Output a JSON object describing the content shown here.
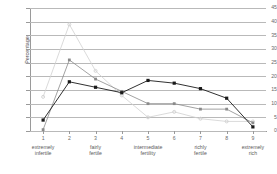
{
  "chart_data": {
    "type": "line",
    "title": "",
    "xlabel": "",
    "ylabel": "Percentage",
    "xlim": [
      0.5,
      9.5
    ],
    "ylim": [
      0,
      45
    ],
    "yticks": [
      0,
      5,
      10,
      15,
      20,
      25,
      30,
      35,
      40,
      45
    ],
    "grid": true,
    "legend": "none",
    "x": [
      1,
      2,
      3,
      4,
      5,
      6,
      7,
      8,
      9
    ],
    "xtick_labels": [
      "1",
      "2",
      "3",
      "4",
      "5",
      "6",
      "7",
      "8",
      "9"
    ],
    "category_labels": [
      {
        "x": 1,
        "label": "extremely\ninfertile"
      },
      {
        "x": 3,
        "label": "fairly\nfertile"
      },
      {
        "x": 5,
        "label": "intermediate\nfertility"
      },
      {
        "x": 7,
        "label": "richly\nfertile"
      },
      {
        "x": 9,
        "label": "extremely\nrich"
      }
    ],
    "series": [
      {
        "name": "series-dark",
        "color": "#1a1a1a",
        "marker": "square",
        "values": [
          4,
          18,
          16,
          14,
          18.5,
          17.5,
          15.5,
          12,
          1.5
        ]
      },
      {
        "name": "series-medium",
        "color": "#8a8a8a",
        "marker": "square",
        "values": [
          0.5,
          26,
          19,
          14.5,
          10,
          10,
          8,
          8,
          3
        ]
      },
      {
        "name": "series-light",
        "color": "#d0d0d0",
        "marker": "circle",
        "values": [
          12.5,
          39,
          22,
          13,
          5,
          7,
          4.5,
          3.5,
          3.5
        ]
      }
    ]
  }
}
